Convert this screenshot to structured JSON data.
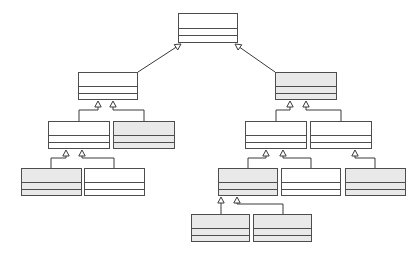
{
  "diagram": {
    "kind": "uml-class-hierarchy",
    "title": "",
    "canvas": {
      "width": 420,
      "height": 260,
      "background": "#ffffff"
    },
    "style": {
      "box_fill_plain": "#ffffff",
      "box_fill_shaded": "#e9e9e9",
      "box_stroke": "#4d4d4d",
      "edge_stroke": "#3a3a3a",
      "arrowhead": "hollow-triangle",
      "relationship": "generalization"
    },
    "compartments_per_class": 3,
    "legend": [],
    "annotations": [],
    "nodes": [
      {
        "id": "n0",
        "name": "",
        "attributes": "",
        "operations": "",
        "shaded": false,
        "level": 0,
        "x": 178,
        "y": 13,
        "w": 60,
        "h": 30,
        "name_h": 14
      },
      {
        "id": "n1",
        "name": "",
        "attributes": "",
        "operations": "",
        "shaded": false,
        "level": 1,
        "x": 78,
        "y": 72,
        "w": 60,
        "h": 28,
        "name_h": 13
      },
      {
        "id": "n2",
        "name": "",
        "attributes": "",
        "operations": "",
        "shaded": true,
        "level": 1,
        "x": 275,
        "y": 72,
        "w": 62,
        "h": 28,
        "name_h": 13
      },
      {
        "id": "n3",
        "name": "",
        "attributes": "",
        "operations": "",
        "shaded": false,
        "level": 2,
        "x": 48,
        "y": 121,
        "w": 62,
        "h": 28,
        "name_h": 13
      },
      {
        "id": "n4",
        "name": "",
        "attributes": "",
        "operations": "",
        "shaded": true,
        "level": 2,
        "x": 113,
        "y": 121,
        "w": 62,
        "h": 28,
        "name_h": 13
      },
      {
        "id": "n5",
        "name": "",
        "attributes": "",
        "operations": "",
        "shaded": false,
        "level": 2,
        "x": 245,
        "y": 121,
        "w": 62,
        "h": 28,
        "name_h": 13
      },
      {
        "id": "n6",
        "name": "",
        "attributes": "",
        "operations": "",
        "shaded": false,
        "level": 2,
        "x": 310,
        "y": 121,
        "w": 62,
        "h": 28,
        "name_h": 13
      },
      {
        "id": "n7",
        "name": "",
        "attributes": "",
        "operations": "",
        "shaded": true,
        "level": 3,
        "x": 21,
        "y": 168,
        "w": 61,
        "h": 28,
        "name_h": 13
      },
      {
        "id": "n8",
        "name": "",
        "attributes": "",
        "operations": "",
        "shaded": false,
        "level": 3,
        "x": 84,
        "y": 168,
        "w": 61,
        "h": 28,
        "name_h": 13
      },
      {
        "id": "n9",
        "name": "",
        "attributes": "",
        "operations": "",
        "shaded": true,
        "level": 3,
        "x": 218,
        "y": 168,
        "w": 60,
        "h": 28,
        "name_h": 13
      },
      {
        "id": "n10",
        "name": "",
        "attributes": "",
        "operations": "",
        "shaded": false,
        "level": 3,
        "x": 281,
        "y": 168,
        "w": 60,
        "h": 28,
        "name_h": 13
      },
      {
        "id": "n11",
        "name": "",
        "attributes": "",
        "operations": "",
        "shaded": true,
        "level": 3,
        "x": 345,
        "y": 168,
        "w": 61,
        "h": 28,
        "name_h": 13
      },
      {
        "id": "n12",
        "name": "",
        "attributes": "",
        "operations": "",
        "shaded": true,
        "level": 4,
        "x": 191,
        "y": 214,
        "w": 59,
        "h": 28,
        "name_h": 13
      },
      {
        "id": "n13",
        "name": "",
        "attributes": "",
        "operations": "",
        "shaded": true,
        "level": 4,
        "x": 253,
        "y": 214,
        "w": 59,
        "h": 28,
        "name_h": 13
      }
    ],
    "edges": [
      {
        "from": "n1",
        "to": "n0",
        "label": "",
        "type": "diagonal",
        "points": "138,72 181,44"
      },
      {
        "from": "n2",
        "to": "n0",
        "label": "",
        "type": "diagonal",
        "points": "275,72 235,44"
      },
      {
        "from": "n3",
        "to": "n1",
        "label": "",
        "type": "elbow",
        "points": "79,121 79,110 98,110 98,101"
      },
      {
        "from": "n4",
        "to": "n1",
        "label": "",
        "type": "elbow",
        "points": "144,121 144,110 113,110 113,101"
      },
      {
        "from": "n5",
        "to": "n2",
        "label": "",
        "type": "elbow",
        "points": "276,121 276,110 290,110 290,101"
      },
      {
        "from": "n6",
        "to": "n2",
        "label": "",
        "type": "elbow",
        "points": "341,121 341,110 306,110 306,101"
      },
      {
        "from": "n7",
        "to": "n3",
        "label": "",
        "type": "elbow",
        "points": "51,168 51,158 66,158 66,150"
      },
      {
        "from": "n8",
        "to": "n3",
        "label": "",
        "type": "elbow",
        "points": "114,168 114,158 82,158 82,150"
      },
      {
        "from": "n9",
        "to": "n5",
        "label": "",
        "type": "elbow",
        "points": "248,168 248,158 266,158 266,150"
      },
      {
        "from": "n10",
        "to": "n5",
        "label": "",
        "type": "elbow",
        "points": "311,168 311,158 283,158 283,150"
      },
      {
        "from": "n11",
        "to": "n6",
        "label": "",
        "type": "elbow",
        "points": "375,168 375,158 355,158 355,150"
      },
      {
        "from": "n12",
        "to": "n9",
        "label": "",
        "type": "elbow",
        "points": "221,214 221,204 221,204 221,197"
      },
      {
        "from": "n13",
        "to": "n9",
        "label": "",
        "type": "elbow",
        "points": "283,214 283,204 237,204 237,197"
      }
    ]
  }
}
